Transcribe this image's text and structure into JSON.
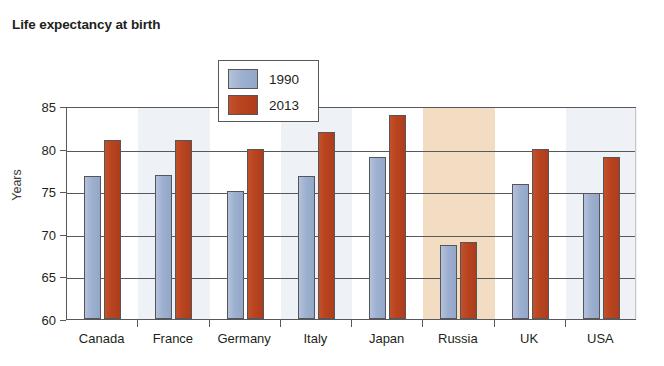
{
  "chart_data": {
    "type": "bar",
    "title": "Life expectancy at birth",
    "xlabel": "",
    "ylabel": "Years",
    "ylim": [
      60,
      85
    ],
    "yticks": [
      60,
      65,
      70,
      75,
      80,
      85
    ],
    "grid": true,
    "legend_position": "top-center",
    "categories": [
      "Canada",
      "France",
      "Germany",
      "Italy",
      "Japan",
      "Russia",
      "UK",
      "USA"
    ],
    "series": [
      {
        "name": "1990",
        "color": "#9db0cf",
        "values": [
          76.8,
          76.9,
          75.0,
          76.8,
          79.0,
          68.7,
          75.8,
          74.8
        ]
      },
      {
        "name": "2013",
        "color": "#b8431f",
        "values": [
          81.0,
          81.0,
          80.0,
          82.0,
          84.0,
          69.0,
          80.0,
          79.0
        ]
      }
    ],
    "highlighted_category": "Russia",
    "highlight_color": "#f2ddc2",
    "band_color": "#e8edf4"
  }
}
